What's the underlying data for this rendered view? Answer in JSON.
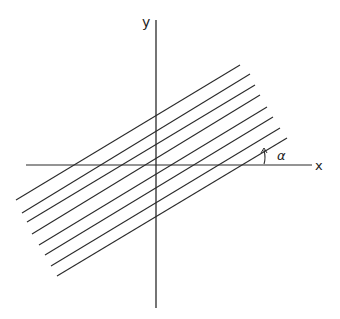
{
  "diagram": {
    "type": "coordinate-system-with-parallel-lines",
    "axes": {
      "x_label": "x",
      "y_label": "y",
      "origin": [
        156,
        165
      ],
      "x_axis": {
        "from": [
          26,
          165
        ],
        "to": [
          312,
          165
        ]
      },
      "y_axis": {
        "from": [
          156,
          20
        ],
        "to": [
          156,
          308
        ]
      }
    },
    "angle": {
      "label": "α",
      "description": "angle between the parallel lines and the x axis"
    },
    "parallel_lines": [
      {
        "from": [
          16,
          200
        ],
        "to": [
          240,
          65
        ]
      },
      {
        "from": [
          22,
          213
        ],
        "to": [
          250,
          74
        ]
      },
      {
        "from": [
          27,
          222
        ],
        "to": [
          255,
          85
        ]
      },
      {
        "from": [
          32,
          234
        ],
        "to": [
          260,
          95
        ]
      },
      {
        "from": [
          39,
          245
        ],
        "to": [
          267,
          107
        ]
      },
      {
        "from": [
          45,
          255
        ],
        "to": [
          273,
          117
        ]
      },
      {
        "from": [
          51,
          266
        ],
        "to": [
          280,
          128
        ]
      },
      {
        "from": [
          57,
          276
        ],
        "to": [
          287,
          138
        ]
      }
    ],
    "line_count": 8,
    "colors": {
      "stroke": "#2a2a2a",
      "background": "#ffffff"
    }
  }
}
